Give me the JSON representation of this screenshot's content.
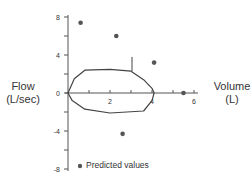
{
  "chart_data": {
    "type": "scatter",
    "title": "",
    "xlabel": "Volume (L)",
    "ylabel": "Flow (L/sec)",
    "xlim": [
      0,
      6
    ],
    "ylim": [
      -8,
      8
    ],
    "x_ticks": [
      "2",
      "4",
      "6"
    ],
    "y_ticks": [
      "8",
      "4",
      "0",
      "-4",
      "-8"
    ],
    "grid": false,
    "legend": {
      "position": "lower-left",
      "entries": [
        "Predicted values"
      ]
    },
    "series": [
      {
        "name": "Predicted values",
        "type": "scatter",
        "points": [
          {
            "x": 0.6,
            "y": 7.4
          },
          {
            "x": 2.3,
            "y": 6.0
          },
          {
            "x": 4.1,
            "y": 3.2
          },
          {
            "x": 5.5,
            "y": 0
          },
          {
            "x": 2.6,
            "y": -4.3
          }
        ]
      },
      {
        "name": "Flow-volume loop",
        "type": "line",
        "points": [
          {
            "x": 0,
            "y": 0
          },
          {
            "x": 0.3,
            "y": 1.5
          },
          {
            "x": 0.8,
            "y": 2.4
          },
          {
            "x": 2.0,
            "y": 2.5
          },
          {
            "x": 3.0,
            "y": 2.3
          },
          {
            "x": 3.6,
            "y": 1.4
          },
          {
            "x": 4.0,
            "y": 0.5
          },
          {
            "x": 4.1,
            "y": 0
          },
          {
            "x": 4.0,
            "y": -0.8
          },
          {
            "x": 3.6,
            "y": -1.9
          },
          {
            "x": 2.0,
            "y": -2.1
          },
          {
            "x": 0.8,
            "y": -1.7
          },
          {
            "x": 0.2,
            "y": -0.8
          },
          {
            "x": 0,
            "y": 0
          }
        ]
      }
    ],
    "annotations": [
      {
        "type": "vertical-marker",
        "x": 3.0,
        "y_from": 2.3,
        "y_to": 3.8
      }
    ]
  },
  "labels": {
    "y_title_line1": "Flow",
    "y_title_line2": "(L/sec)",
    "x_title_line1": "Volume",
    "x_title_line2": "(L)",
    "legend_text": "Predicted values"
  },
  "colors": {
    "axis": "#555555",
    "dot": "#555555",
    "line": "#444444"
  }
}
